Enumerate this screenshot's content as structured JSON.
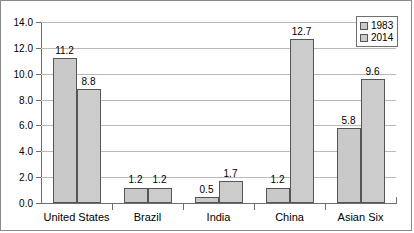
{
  "chart_data": {
    "type": "bar",
    "title": "",
    "xlabel": "",
    "ylabel": "",
    "categories": [
      "United States",
      "Brazil",
      "India",
      "China",
      "Asian Six"
    ],
    "series": [
      {
        "name": "1983",
        "values": [
          11.2,
          1.2,
          0.5,
          1.2,
          5.8
        ],
        "color": "#c9c9c9"
      },
      {
        "name": "2014",
        "values": [
          8.8,
          1.2,
          1.7,
          12.7,
          9.6
        ],
        "color": "#cccccc"
      }
    ],
    "ylim": [
      0.0,
      14.0
    ],
    "ytick_labels": [
      "0.0",
      "2.0",
      "4.0",
      "6.0",
      "8.0",
      "10.0",
      "12.0",
      "14.0"
    ],
    "ytick_values": [
      0.0,
      2.0,
      4.0,
      6.0,
      8.0,
      10.0,
      12.0,
      14.0
    ],
    "grid": true,
    "legend_position": "top-right",
    "data_labels": [
      [
        "11.2",
        "1.2",
        "0.5",
        "1.2",
        "5.8"
      ],
      [
        "8.8",
        "1.2",
        "1.7",
        "12.7",
        "9.6"
      ]
    ]
  },
  "legend": {
    "entries": [
      {
        "label": "1983"
      },
      {
        "label": "2014"
      }
    ]
  }
}
